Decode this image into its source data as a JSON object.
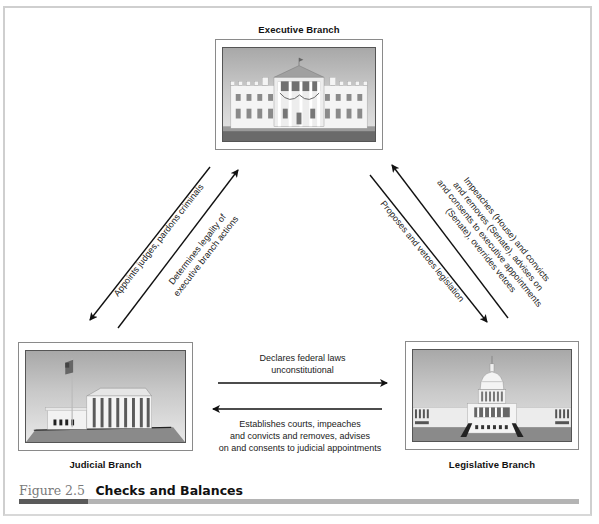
{
  "figure": {
    "number": "Figure 2.5",
    "title": "Checks and Balances",
    "accent_dark": "#5a5a5a",
    "accent_light": "#b4b4b4"
  },
  "branches": {
    "executive": {
      "label": "Executive Branch",
      "image": "white-house-illustration"
    },
    "judicial": {
      "label": "Judicial Branch",
      "image": "supreme-court-illustration"
    },
    "legislative": {
      "label": "Legislative Branch",
      "image": "capitol-building-illustration"
    }
  },
  "relations": {
    "executive_to_judicial": "Appoints judges, pardons criminals",
    "judicial_to_executive": [
      "Determines legality of",
      "executive branch actions"
    ],
    "executive_to_legislative": "Proposes and vetoes legislation",
    "legislative_to_executive": [
      "Impeaches (House) and convicts",
      "and removes (Senate), advises on",
      "and consents to executive appointments",
      "(Senate), overrides vetoes"
    ],
    "judicial_to_legislative": [
      "Declares federal laws",
      "unconstitutional"
    ],
    "legislative_to_judicial": [
      "Establishes courts, impeaches",
      "and convicts and removes, advises",
      "on and consents to judicial appointments"
    ]
  }
}
